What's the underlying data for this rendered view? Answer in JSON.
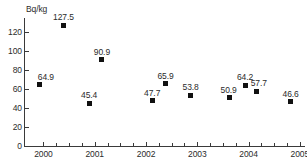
{
  "chart_data": {
    "type": "scatter",
    "title": "",
    "xlabel": "",
    "ylabel": "Bq/kg",
    "xlim": [
      1999.62,
      2005.1
    ],
    "ylim": [
      0,
      132
    ],
    "grid": false,
    "legend": null,
    "y_ticks": [
      0,
      20,
      40,
      60,
      80,
      100,
      120
    ],
    "y_tick_labels": [
      "0",
      "20",
      "40",
      "60",
      "80",
      "100",
      "120"
    ],
    "x_ticks": [
      2000,
      2001,
      2002,
      2003,
      2004,
      2005
    ],
    "x_tick_labels": [
      "2000",
      "2001",
      "2002",
      "2003",
      "2004",
      "2005"
    ],
    "x_minor_ticks": [
      2000.25,
      2000.5,
      2000.75,
      2001.25,
      2001.5,
      2001.75,
      2002.25,
      2002.5,
      2002.75,
      2003.25,
      2003.5,
      2003.75,
      2004.25,
      2004.5,
      2004.75
    ],
    "marker": "filled-square",
    "marker_color": "#111111",
    "points": [
      {
        "x": 1999.93,
        "y": 64.9,
        "label": "64.9",
        "label_dx": 6,
        "label_dy": -9
      },
      {
        "x": 2000.39,
        "y": 127.5,
        "label": "127.5",
        "label_dx": 0,
        "label_dy": -9
      },
      {
        "x": 2000.89,
        "y": 45.4,
        "label": "45.4",
        "label_dx": 0,
        "label_dy": -9
      },
      {
        "x": 2001.14,
        "y": 90.9,
        "label": "90.9",
        "label_dx": 0,
        "label_dy": -9
      },
      {
        "x": 2002.12,
        "y": 47.7,
        "label": "47.7",
        "label_dx": 0,
        "label_dy": -9
      },
      {
        "x": 2002.38,
        "y": 65.9,
        "label": "65.9",
        "label_dx": 0,
        "label_dy": -9
      },
      {
        "x": 2002.87,
        "y": 53.8,
        "label": "53.8",
        "label_dx": 0,
        "label_dy": -9
      },
      {
        "x": 2003.63,
        "y": 50.9,
        "label": "50.9",
        "label_dx": -1,
        "label_dy": -9
      },
      {
        "x": 2003.93,
        "y": 64.2,
        "label": "64.2",
        "label_dx": 0,
        "label_dy": -9
      },
      {
        "x": 2004.16,
        "y": 57.7,
        "label": "57.7",
        "label_dx": 2,
        "label_dy": -9
      },
      {
        "x": 2004.82,
        "y": 46.6,
        "label": "46.6",
        "label_dx": 0,
        "label_dy": -9
      }
    ]
  }
}
